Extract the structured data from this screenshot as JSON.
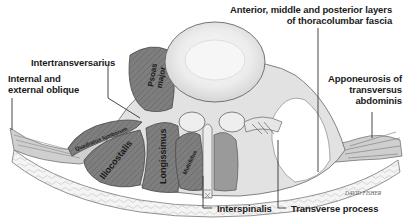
{
  "diagram": {
    "callouts": {
      "fascia_line1": "Anterior, middle and posterior layers",
      "fascia_line2": "of thoracolumbar fascia",
      "intertransversarius": "Intertransversarius",
      "oblique_line1": "Internal and",
      "oblique_line2": "external oblique",
      "aponeurosis_line1": "Apponeurosis of",
      "aponeurosis_line2": "transversus",
      "aponeurosis_line3": "abdominis",
      "interspinalis": "Interspinalis",
      "transverse_process": "Transverse process"
    },
    "muscle_labels": {
      "psoas_line1": "Psoas",
      "psoas_line2": "major",
      "quadratus": "Quadratus lumborum",
      "iliocostalis": "Iliocostalis",
      "longissimus": "Longissimus",
      "multifidus": "Multifidus"
    },
    "signature": "DAVID FISHER",
    "colors": {
      "muscle": "#7d7d7d",
      "muscle_dark": "#5e5e5e",
      "fascia": "#d9d9d9",
      "bone": "#ededed",
      "fat": "#f2f2f2",
      "outline": "#555555",
      "leader_line": "#333333"
    }
  }
}
